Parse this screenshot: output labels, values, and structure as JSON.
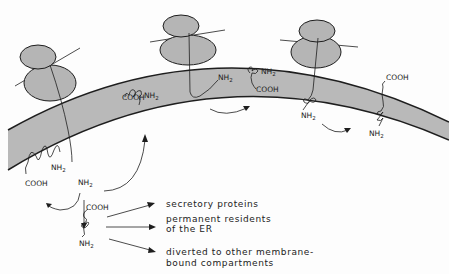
{
  "diagram": {
    "colors": {
      "membrane_fill": "#b9b9b9",
      "ribosome_fill": "#b5b5b5",
      "line": "#1e1e1e",
      "background": "#fdfdfd"
    },
    "labels": {
      "nh2": "NH",
      "nh2_sub": "2",
      "cooh": "COOH"
    },
    "fates": [
      {
        "line1": "secretory  proteins",
        "line2": ""
      },
      {
        "line1": "permanent  residents",
        "line2": "of  the  ER"
      },
      {
        "line1": "diverted to  other  membrane-",
        "line2": "bound  compartments"
      }
    ]
  }
}
